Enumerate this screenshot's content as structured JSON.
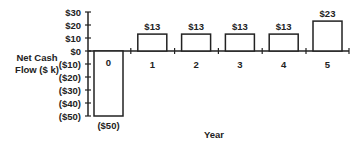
{
  "chart_data": {
    "type": "bar",
    "title": "",
    "xlabel": "Year",
    "ylabel": "Net Cash Flow ($ k)",
    "ylabel_lines": [
      "Net Cash",
      "Flow ($ k)"
    ],
    "categories": [
      "0",
      "1",
      "2",
      "3",
      "4",
      "5"
    ],
    "values": [
      -50,
      13,
      13,
      13,
      13,
      23
    ],
    "data_labels": [
      "($50)",
      "$13",
      "$13",
      "$13",
      "$13",
      "$23"
    ],
    "ylim": [
      -50,
      30
    ],
    "yticks": [
      30,
      20,
      10,
      0,
      -10,
      -20,
      -30,
      -40,
      -50
    ],
    "ytick_labels": [
      "$30",
      "$20",
      "$10",
      "$0",
      "($10)",
      "($20)",
      "($30)",
      "($40)",
      "($50)"
    ],
    "grid": false,
    "legend": null,
    "bar_fill": "#ffffff",
    "bar_stroke": "#222222"
  }
}
